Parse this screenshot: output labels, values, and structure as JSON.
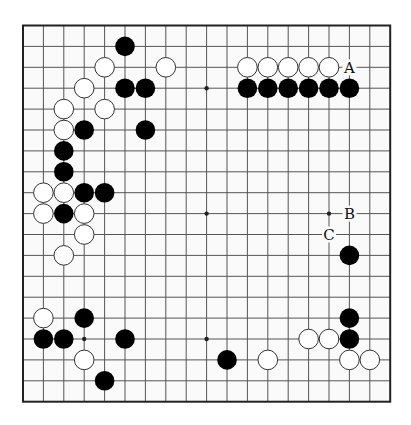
{
  "board": {
    "size": 19,
    "origin_x": 23,
    "origin_y": 25.5,
    "spacing_x": 20.4,
    "spacing_y": 20.9,
    "stone_radius": 9.8,
    "star_radius": 2.2,
    "colors": {
      "background": "#ffffff",
      "board_fill": "#fafafa",
      "border": "#222222",
      "grid": "#555555",
      "black_stone": "#000000",
      "white_stone": "#ffffff",
      "white_outline": "#333333",
      "label": "#111111"
    }
  },
  "star_points": [
    [
      3,
      3
    ],
    [
      9,
      3
    ],
    [
      15,
      3
    ],
    [
      3,
      9
    ],
    [
      9,
      9
    ],
    [
      15,
      9
    ],
    [
      3,
      15
    ],
    [
      9,
      15
    ],
    [
      15,
      15
    ]
  ],
  "black_stones": [
    [
      5,
      1
    ],
    [
      5,
      3
    ],
    [
      6,
      3
    ],
    [
      3,
      5
    ],
    [
      6,
      5
    ],
    [
      2,
      6
    ],
    [
      2,
      7
    ],
    [
      3,
      8
    ],
    [
      4,
      8
    ],
    [
      2,
      9
    ],
    [
      11,
      3
    ],
    [
      12,
      3
    ],
    [
      13,
      3
    ],
    [
      14,
      3
    ],
    [
      15,
      3
    ],
    [
      16,
      3
    ],
    [
      16,
      11
    ],
    [
      3,
      14
    ],
    [
      16,
      14
    ],
    [
      1,
      15
    ],
    [
      2,
      15
    ],
    [
      5,
      15
    ],
    [
      16,
      15
    ],
    [
      10,
      16
    ],
    [
      4,
      17
    ]
  ],
  "white_stones": [
    [
      4,
      2
    ],
    [
      7,
      2
    ],
    [
      11,
      2
    ],
    [
      12,
      2
    ],
    [
      13,
      2
    ],
    [
      14,
      2
    ],
    [
      15,
      2
    ],
    [
      3,
      3
    ],
    [
      2,
      4
    ],
    [
      4,
      4
    ],
    [
      2,
      5
    ],
    [
      1,
      8
    ],
    [
      2,
      8
    ],
    [
      1,
      9
    ],
    [
      3,
      9
    ],
    [
      3,
      10
    ],
    [
      2,
      11
    ],
    [
      1,
      14
    ],
    [
      14,
      15
    ],
    [
      15,
      15
    ],
    [
      3,
      16
    ],
    [
      12,
      16
    ],
    [
      16,
      16
    ],
    [
      17,
      16
    ]
  ],
  "labels": [
    {
      "text": "A",
      "col": 16,
      "row": 2
    },
    {
      "text": "B",
      "col": 16,
      "row": 9
    },
    {
      "text": "C",
      "col": 15,
      "row": 10
    }
  ]
}
